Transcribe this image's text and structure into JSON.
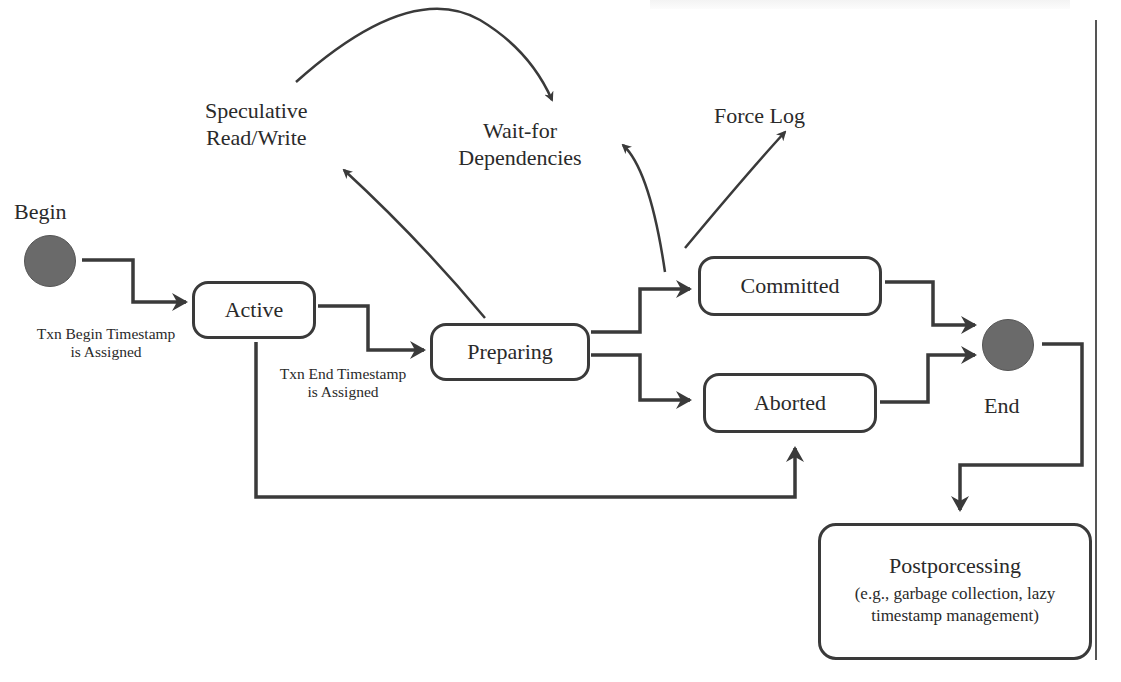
{
  "diagram": {
    "type": "state-diagram",
    "start": {
      "label": "Begin",
      "note": [
        "Txn Begin Timestamp",
        "is Assigned"
      ]
    },
    "end": {
      "label": "End"
    },
    "states": [
      {
        "id": "active",
        "label": "Active"
      },
      {
        "id": "preparing",
        "label": "Preparing"
      },
      {
        "id": "committed",
        "label": "Committed"
      },
      {
        "id": "aborted",
        "label": "Aborted"
      }
    ],
    "preparing_note": [
      "Txn End Timestamp",
      "is Assigned"
    ],
    "actions": {
      "speculative": [
        "Speculative",
        "Read/Write"
      ],
      "wait_for": [
        "Wait-for",
        "Dependencies"
      ],
      "force_log": "Force Log"
    },
    "postprocessing": {
      "title": "Postporcessing",
      "detail": [
        "(e.g., garbage collection, lazy",
        "timestamp management)"
      ]
    },
    "edges": [
      {
        "from": "Begin",
        "to": "Active"
      },
      {
        "from": "Active",
        "to": "Preparing"
      },
      {
        "from": "Active",
        "to": "Aborted"
      },
      {
        "from": "Preparing",
        "to": "Committed"
      },
      {
        "from": "Preparing",
        "to": "Aborted"
      },
      {
        "from": "Preparing",
        "to": "Speculative Read/Write"
      },
      {
        "from": "Speculative Read/Write",
        "to": "Wait-for Dependencies"
      },
      {
        "from": "Committed",
        "to": "Wait-for Dependencies"
      },
      {
        "from": "Committed",
        "to": "Force Log"
      },
      {
        "from": "Committed",
        "to": "End"
      },
      {
        "from": "Aborted",
        "to": "End"
      },
      {
        "from": "End",
        "to": "Postporcessing"
      }
    ],
    "colors": {
      "line": "#3a3a3a",
      "node_fill": "#6a6a6a"
    }
  }
}
